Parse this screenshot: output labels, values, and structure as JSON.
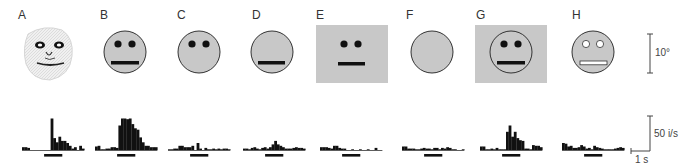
{
  "figure": {
    "panels": [
      {
        "label": "A",
        "stimulus": "monkey-face-drawing",
        "label_x": 18
      },
      {
        "label": "B",
        "stimulus": "circle-two-eyes-mouth",
        "label_x": 100
      },
      {
        "label": "C",
        "stimulus": "circle-two-eyes",
        "label_x": 177
      },
      {
        "label": "D",
        "stimulus": "circle-mouth-only",
        "label_x": 252
      },
      {
        "label": "E",
        "stimulus": "square-eyes-mouth-no-outline",
        "label_x": 316
      },
      {
        "label": "F",
        "stimulus": "blank-circle",
        "label_x": 406
      },
      {
        "label": "G",
        "stimulus": "circle-eyes-mouth-on-square",
        "label_x": 476
      },
      {
        "label": "H",
        "stimulus": "circle-contrast-reversed-features",
        "label_x": 572
      }
    ],
    "scale_bars": {
      "angle": "10°",
      "rate": "50 i/s",
      "time": "1 s"
    },
    "colors": {
      "face_fill": "#c8c8c8",
      "ink": "#111111",
      "background": "#ffffff"
    }
  },
  "chart_data": {
    "type": "bar",
    "title": "",
    "xlabel": "time (stimulus bar = presentation period)",
    "ylabel": "firing rate (i/s)",
    "scale": {
      "y_bar": "50 i/s",
      "x_bar": "1 s",
      "angle_bar": "10°"
    },
    "series": [
      {
        "name": "A",
        "values": [
          4,
          4,
          3,
          0,
          0,
          0,
          0,
          0,
          0,
          0,
          0,
          45,
          17,
          11,
          19,
          13,
          13,
          10,
          6,
          2,
          4,
          0,
          6,
          2
        ]
      },
      {
        "name": "B",
        "values": [
          5,
          6,
          1,
          1,
          2,
          2,
          4,
          4,
          3,
          35,
          45,
          45,
          44,
          45,
          37,
          31,
          29,
          18,
          11,
          6,
          6,
          4,
          4,
          4
        ]
      },
      {
        "name": "C",
        "values": [
          1,
          1,
          2,
          2,
          6,
          6,
          4,
          4,
          4,
          6,
          0,
          10,
          2,
          0,
          3,
          1,
          1,
          2,
          1,
          2,
          1,
          2,
          2,
          1
        ]
      },
      {
        "name": "D",
        "values": [
          2,
          2,
          1,
          3,
          4,
          2,
          1,
          3,
          4,
          2,
          4,
          8,
          13,
          8,
          6,
          4,
          2,
          2,
          2,
          3,
          4,
          3,
          3,
          2
        ]
      },
      {
        "name": "E",
        "values": [
          4,
          4,
          4,
          3,
          2,
          6,
          6,
          3,
          2,
          2,
          0,
          0,
          1,
          0,
          0,
          1,
          0,
          0,
          1,
          0,
          0,
          3,
          0,
          0
        ]
      },
      {
        "name": "F",
        "values": [
          5,
          5,
          2,
          2,
          2,
          1,
          1,
          2,
          3,
          2,
          2,
          1,
          3,
          3,
          1,
          3,
          2,
          4,
          3,
          1,
          1,
          0,
          0,
          1
        ]
      },
      {
        "name": "G",
        "values": [
          5,
          5,
          1,
          1,
          2,
          1,
          3,
          1,
          1,
          1,
          26,
          35,
          19,
          26,
          17,
          14,
          13,
          2,
          2,
          1,
          7,
          6,
          6,
          4
        ]
      },
      {
        "name": "H",
        "values": [
          10,
          9,
          5,
          6,
          3,
          3,
          4,
          7,
          5,
          2,
          3,
          1,
          6,
          4,
          3,
          2,
          1,
          1,
          1,
          1,
          2,
          3,
          4,
          3
        ]
      }
    ]
  }
}
